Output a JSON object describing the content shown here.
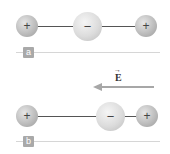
{
  "panels": [
    {
      "label": "a",
      "charges": [
        {
          "sign": "+",
          "type": "positive"
        },
        {
          "sign": "−",
          "type": "negative"
        },
        {
          "sign": "+",
          "type": "positive"
        }
      ]
    },
    {
      "label": "b",
      "charges": [
        {
          "sign": "+",
          "type": "positive"
        },
        {
          "sign": "−",
          "type": "negative"
        },
        {
          "sign": "+",
          "type": "positive"
        }
      ]
    }
  ],
  "field": {
    "symbol": "E",
    "vector_mark": "→",
    "direction": "left"
  },
  "colors": {
    "arrow": "#a7a7a7",
    "tag": "#a9a9a9",
    "divider": "#d6d6d6",
    "rod": "#555555"
  }
}
